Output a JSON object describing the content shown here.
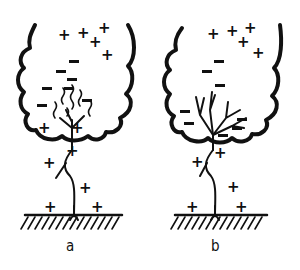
{
  "figure": {
    "panels": [
      {
        "label": "a",
        "description": "Thundercloud with upper positive charges, lower negative charges and wavy streamers; stepped leader descending toward positively charged ground",
        "cloud_positive_charges": 5,
        "cloud_negative_charges": 6,
        "lower_positive_charges": 2,
        "air_positive_charges": 3,
        "ground_positive_charges": 2
      },
      {
        "label": "b",
        "description": "Thundercloud with branched discharge channel at cloud base among negative charges; leader connected to ground",
        "cloud_positive_charges": 5,
        "cloud_negative_charges": 8,
        "air_positive_charges": 3,
        "ground_positive_charges": 2
      }
    ],
    "colors": {
      "ink": "#111111",
      "background": "#ffffff"
    }
  }
}
